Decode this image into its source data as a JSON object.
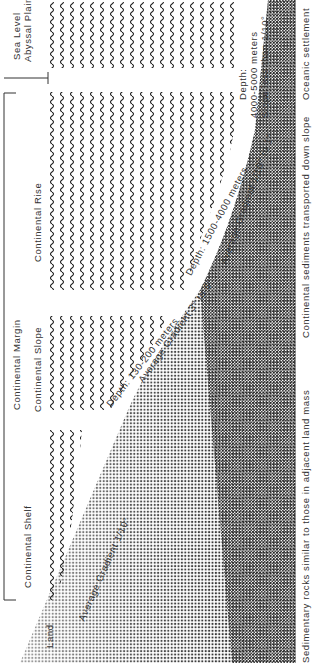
{
  "diagram": {
    "title": "Continental Margin",
    "orientation": "rotated 90 degrees counter-clockwise",
    "zones": {
      "land": "Land",
      "continental_margin": "Continental Margin",
      "continental_shelf": "Continental Shelf",
      "continental_slope": "Continental Slope",
      "continental_rise": "Continental Rise",
      "sea_level": "Sea Level",
      "abyssal_plain": "Abyssal Plain"
    },
    "gradients": {
      "shelf": "Average Gradient 1/10°",
      "slope": "Average Gradient 3° to 6°",
      "rise": "Average Gradient 1/10° to 1°",
      "abyssal": "Slope less than 1/10°"
    },
    "depths": {
      "shelf_break": "Depth: 130-200 meters",
      "rise": "Depth: 1500-4000 meters",
      "abyssal_label": "Depth:",
      "abyssal_value": "4000-5000 meters"
    },
    "sediments": {
      "shelf": "Sedimentary rocks similar to those in adjacent land mass",
      "slope_rise": "Continental sediments transported down slope",
      "abyssal": "Oceanic settlement"
    },
    "colors": {
      "background": "#ffffff",
      "ink": "#222222",
      "seafloor_dots": "#333333"
    }
  }
}
